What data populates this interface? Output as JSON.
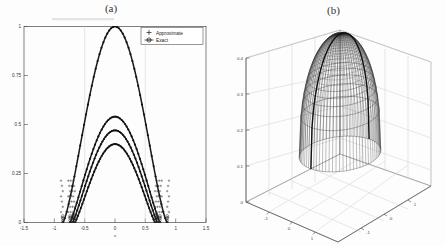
{
  "figure": {
    "panels": [
      {
        "id": "a",
        "title": "(a)",
        "type": "line",
        "xlabel": "x",
        "ylabel": "",
        "xlim": [
          -1.5,
          1.5
        ],
        "ylim": [
          0,
          1
        ],
        "xticks": [
          "-1.5",
          "-1",
          "-0.5",
          "0",
          "0.5",
          "1",
          "1.5"
        ],
        "xtick_values": [
          -1.5,
          -1,
          -0.5,
          0,
          0.5,
          1,
          1.5
        ],
        "yticks": [
          "0",
          "0.25",
          "0.5",
          "0.75",
          "1"
        ],
        "ytick_values": [
          0,
          0.25,
          0.5,
          0.75,
          1
        ],
        "grid": false,
        "legend": {
          "position": "upper-right",
          "entries": [
            {
              "label": "Approximate",
              "marker": "plus",
              "line": "none"
            },
            {
              "label": "Exact",
              "marker": "circle-cross",
              "line": "solid"
            }
          ]
        },
        "series": [
          {
            "name": "curve-1",
            "peak": 1.0,
            "half_width": 0.86,
            "marker": "circle"
          },
          {
            "name": "curve-2",
            "peak": 0.54,
            "half_width": 0.74,
            "marker": "circle"
          },
          {
            "name": "curve-3",
            "peak": 0.47,
            "half_width": 0.7,
            "marker": "circle"
          },
          {
            "name": "curve-4",
            "peak": 0.4,
            "half_width": 0.66,
            "marker": "circle"
          }
        ]
      },
      {
        "id": "b",
        "title": "(b)",
        "type": "surface",
        "xlim": [
          -1,
          1
        ],
        "ylim": [
          -1,
          1
        ],
        "zlim": [
          0,
          0.4
        ],
        "xticks": [
          "-1",
          "0",
          "1"
        ],
        "yticks": [
          "1",
          "0",
          "-1"
        ],
        "zticks": [
          "0",
          "0.1",
          "0.2",
          "0.3",
          "0.4"
        ],
        "ztick_values": [
          0,
          0.1,
          0.2,
          0.3,
          0.4
        ],
        "grid": true,
        "surface": {
          "shape": "bullet-dome",
          "peak_z": 0.4,
          "mesh": "dense-wireframe"
        }
      }
    ]
  },
  "chart_data": [
    {
      "type": "line",
      "title": "(a)",
      "xlabel": "x",
      "ylabel": "",
      "xlim": [
        -1.5,
        1.5
      ],
      "ylim": [
        0,
        1
      ],
      "categories": [],
      "xticklabels": [
        "-1.5",
        "-1",
        "-0.5",
        "0",
        "0.5",
        "1",
        "1.5"
      ],
      "yticklabels": [
        "0",
        "0.25",
        "0.5",
        "0.75",
        "1"
      ],
      "grid": false,
      "legend": [
        "Approximate",
        "Exact"
      ],
      "legend_position": "upper right",
      "x": [
        -0.9,
        -0.85,
        -0.8,
        -0.75,
        -0.7,
        -0.65,
        -0.6,
        -0.5,
        -0.4,
        -0.3,
        -0.2,
        -0.1,
        0.0,
        0.1,
        0.2,
        0.3,
        0.4,
        0.5,
        0.6,
        0.65,
        0.7,
        0.75,
        0.8,
        0.85,
        0.9
      ],
      "series": [
        {
          "name": "Exact (tallest)",
          "values": [
            0.0,
            0.03,
            0.1,
            0.22,
            0.38,
            0.55,
            0.69,
            0.86,
            0.95,
            0.99,
            1.0,
            1.0,
            1.0,
            1.0,
            1.0,
            0.99,
            0.95,
            0.86,
            0.69,
            0.55,
            0.38,
            0.22,
            0.1,
            0.03,
            0.0
          ]
        },
        {
          "name": "Exact (third)",
          "values": [
            0.0,
            0.0,
            0.0,
            0.02,
            0.09,
            0.19,
            0.28,
            0.41,
            0.48,
            0.52,
            0.54,
            0.54,
            0.54,
            0.54,
            0.54,
            0.52,
            0.48,
            0.41,
            0.28,
            0.19,
            0.09,
            0.02,
            0.0,
            0.0,
            0.0
          ]
        },
        {
          "name": "Exact (second)",
          "values": [
            0.0,
            0.0,
            0.0,
            0.01,
            0.07,
            0.16,
            0.24,
            0.35,
            0.42,
            0.45,
            0.47,
            0.47,
            0.47,
            0.47,
            0.47,
            0.45,
            0.42,
            0.35,
            0.24,
            0.16,
            0.07,
            0.01,
            0.0,
            0.0,
            0.0
          ]
        },
        {
          "name": "Exact (lowest)",
          "values": [
            0.0,
            0.0,
            0.0,
            0.0,
            0.05,
            0.13,
            0.2,
            0.3,
            0.36,
            0.39,
            0.4,
            0.4,
            0.4,
            0.4,
            0.4,
            0.39,
            0.36,
            0.3,
            0.2,
            0.13,
            0.05,
            0.0,
            0.0,
            0.0,
            0.0
          ]
        }
      ]
    },
    {
      "type": "surface",
      "title": "(b)",
      "xlabel": "",
      "ylabel": "",
      "zlabel": "",
      "xlim": [
        -1,
        1
      ],
      "ylim": [
        -1,
        1
      ],
      "zlim": [
        0,
        0.4
      ],
      "xticklabels": [
        "-1",
        "0",
        "1"
      ],
      "yticklabels": [
        "1",
        "0",
        "-1"
      ],
      "zticklabels": [
        "0",
        "0.1",
        "0.2",
        "0.3",
        "0.4"
      ],
      "grid": true,
      "description": "radially symmetric bullet-shaped dome, dense wireframe mesh, peak z = 0.4"
    }
  ]
}
